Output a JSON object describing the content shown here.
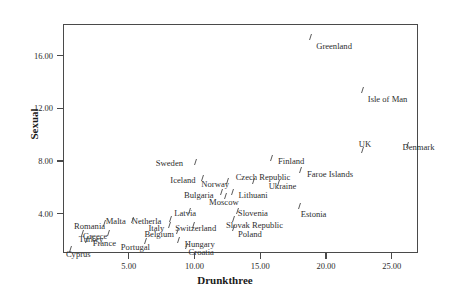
{
  "chart_data": {
    "type": "scatter",
    "title": "",
    "xlabel": "Drunkthree",
    "ylabel": "Sexual",
    "xlim": [
      0.0,
      27.0
    ],
    "ylim": [
      1.0,
      18.4
    ],
    "grid": false,
    "legend": "none",
    "xticks": [
      "5.00",
      "10.00",
      "15.00",
      "20.00",
      "25.00"
    ],
    "xtick_values": [
      5,
      10,
      15,
      20,
      25
    ],
    "yticks": [
      "4.00",
      "8.00",
      "12.00",
      "16.00"
    ],
    "ytick_values": [
      4,
      8,
      12,
      16
    ],
    "points": [
      {
        "label": "Greenland",
        "x": 18.8,
        "y": 17.4,
        "lx": 6,
        "ly": 5
      },
      {
        "label": "Isle of Man",
        "x": 22.8,
        "y": 13.4,
        "lx": 5,
        "ly": 5
      },
      {
        "label": "UK",
        "x": 22.8,
        "y": 8.8,
        "lx": -4,
        "ly": -10
      },
      {
        "label": "Denmark",
        "x": 26.2,
        "y": 9.2,
        "lx": -5,
        "ly": -2
      },
      {
        "label": "Finland",
        "x": 15.9,
        "y": 8.2,
        "lx": 6,
        "ly": -1
      },
      {
        "label": "Faroe Islands",
        "x": 18.1,
        "y": 7.3,
        "lx": 6,
        "ly": 0
      },
      {
        "label": "Sweden",
        "x": 10.1,
        "y": 7.9,
        "lx": -40,
        "ly": -3
      },
      {
        "label": "Iceland",
        "x": 10.6,
        "y": 6.7,
        "lx": -32,
        "ly": -2
      },
      {
        "label": "Czech Republic",
        "x": 14.5,
        "y": 6.5,
        "lx": -18,
        "ly": -8
      },
      {
        "label": "Norway",
        "x": 12.5,
        "y": 6.5,
        "lx": -26,
        "ly": -1
      },
      {
        "label": "Ukraine",
        "x": 16.4,
        "y": 6.3,
        "lx": -10,
        "ly": -1
      },
      {
        "label": "Lithuani",
        "x": 12.9,
        "y": 5.6,
        "lx": 6,
        "ly": -1
      },
      {
        "label": "Bulgaria",
        "x": 12.1,
        "y": 5.6,
        "lx": -38,
        "ly": -1
      },
      {
        "label": "Moscow",
        "x": 12.4,
        "y": 5.3,
        "lx": -17,
        "ly": 2
      },
      {
        "label": "Estonia",
        "x": 18.0,
        "y": 4.6,
        "lx": 1,
        "ly": 4
      },
      {
        "label": "Latvia",
        "x": 9.6,
        "y": 4.2,
        "lx": -15,
        "ly": -2
      },
      {
        "label": "Slovenia",
        "x": 13.3,
        "y": 4.2,
        "lx": 0,
        "ly": -2
      },
      {
        "label": "Netherla",
        "x": 8.2,
        "y": 3.6,
        "lx": -39,
        "ly": -2
      },
      {
        "label": "Slovak Republic",
        "x": 13.0,
        "y": 3.6,
        "lx": -8,
        "ly": 2
      },
      {
        "label": "Italy",
        "x": 8.1,
        "y": 3.1,
        "lx": -21,
        "ly": -1
      },
      {
        "label": "Switzerland",
        "x": 9.9,
        "y": 3.1,
        "lx": -18,
        "ly": -1
      },
      {
        "label": "Poland",
        "x": 13.0,
        "y": 2.9,
        "lx": 4,
        "ly": 2
      },
      {
        "label": "Belgium",
        "x": 8.7,
        "y": 2.7,
        "lx": -33,
        "ly": -1
      },
      {
        "label": "Malta",
        "x": 5.3,
        "y": 3.5,
        "lx": -27,
        "ly": -3
      },
      {
        "label": "Romania",
        "x": 3.2,
        "y": 3.3,
        "lx": -31,
        "ly": -1
      },
      {
        "label": "Netherlands-group",
        "x": 7.1,
        "y": 3.0,
        "lx": 0,
        "ly": 0
      },
      {
        "label": "Greece",
        "x": 3.5,
        "y": 2.5,
        "lx": -26,
        "ly": -1
      },
      {
        "label": "Turkey",
        "x": 1.5,
        "y": 2.5,
        "lx": -4,
        "ly": 2
      },
      {
        "label": "France",
        "x": 1.8,
        "y": 2.0,
        "lx": 6,
        "ly": -1
      },
      {
        "label": "Portugal",
        "x": 6.3,
        "y": 1.9,
        "lx": -25,
        "ly": 2
      },
      {
        "label": "Hungary",
        "x": 8.8,
        "y": 2.0,
        "lx": 6,
        "ly": 0
      },
      {
        "label": "Croatia",
        "x": 9.4,
        "y": 1.5,
        "lx": 2,
        "ly": 2
      },
      {
        "label": "Cyprus",
        "x": 0.6,
        "y": 1.3,
        "lx": -5,
        "ly": 1
      }
    ]
  },
  "axes": {
    "x_title": "Drunkthree",
    "y_title": "Sexual"
  },
  "colors": {
    "axis": "#4a4a4a",
    "marker": "#5a5a5a",
    "text": "#2e2e2e",
    "background": "#ffffff"
  }
}
